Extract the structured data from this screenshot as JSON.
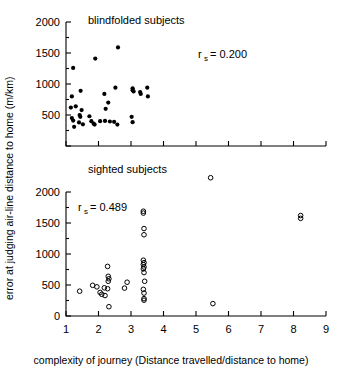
{
  "figure": {
    "xlabel": "complexity of journey (Distance travelled/distance to home)",
    "ylabel": "error at judging air-line distance to home (m/km)"
  },
  "chart_data": [
    {
      "type": "scatter",
      "title": "blindfolded subjects",
      "panel": "top",
      "marker": "filled-circle",
      "annotation": "r_s = 0.200",
      "annotation_symbol": "r",
      "annotation_subscript": "s",
      "annotation_value": "= 0.200",
      "xlabel": "complexity of journey (Distance travelled/distance to home)",
      "ylabel": "error at judging air-line distance to home (m/km)",
      "xlim": [
        1,
        9
      ],
      "ylim": [
        0,
        2000
      ],
      "xticks": [
        1,
        2,
        3,
        4,
        5,
        6,
        7,
        8,
        9
      ],
      "xticklabels": [
        "",
        "",
        "",
        "",
        "",
        "",
        "",
        "",
        ""
      ],
      "yticks": [
        0,
        500,
        1000,
        1500,
        2000
      ],
      "yticklabels": [
        "",
        "500",
        "1000",
        "1500",
        "2000"
      ],
      "grid": false,
      "legend": "none",
      "points": [
        [
          1.22,
          1260
        ],
        [
          1.18,
          800
        ],
        [
          1.15,
          620
        ],
        [
          1.3,
          640
        ],
        [
          1.18,
          450
        ],
        [
          1.22,
          410
        ],
        [
          1.25,
          310
        ],
        [
          1.45,
          890
        ],
        [
          1.48,
          580
        ],
        [
          1.42,
          500
        ],
        [
          1.44,
          470
        ],
        [
          1.4,
          380
        ],
        [
          1.52,
          350
        ],
        [
          1.9,
          1410
        ],
        [
          1.72,
          480
        ],
        [
          1.78,
          400
        ],
        [
          1.85,
          360
        ],
        [
          1.88,
          345
        ],
        [
          2.05,
          400
        ],
        [
          2.18,
          840
        ],
        [
          2.3,
          700
        ],
        [
          2.22,
          600
        ],
        [
          2.2,
          405
        ],
        [
          2.35,
          395
        ],
        [
          2.6,
          1590
        ],
        [
          2.52,
          940
        ],
        [
          2.48,
          390
        ],
        [
          2.58,
          345
        ],
        [
          3.05,
          930
        ],
        [
          3.05,
          900
        ],
        [
          3.08,
          880
        ],
        [
          3.02,
          470
        ],
        [
          3.05,
          385
        ],
        [
          3.28,
          870
        ],
        [
          3.3,
          840
        ],
        [
          3.5,
          940
        ],
        [
          3.52,
          800
        ]
      ]
    },
    {
      "type": "scatter",
      "title": "sighted subjects",
      "panel": "bottom",
      "marker": "open-circle",
      "annotation": "r_s = 0.489",
      "annotation_symbol": "r",
      "annotation_subscript": "s",
      "annotation_value": "= 0.489",
      "xlabel": "complexity of journey (Distance travelled/distance to home)",
      "ylabel": "error at judging air-line distance to home (m/km)",
      "xlim": [
        1,
        9
      ],
      "ylim": [
        0,
        2000
      ],
      "xticks": [
        1,
        2,
        3,
        4,
        5,
        6,
        7,
        8,
        9
      ],
      "xticklabels": [
        "1",
        "2",
        "3",
        "4",
        "5",
        "6",
        "7",
        "8",
        "9"
      ],
      "yticks": [
        0,
        500,
        1000,
        1500,
        2000
      ],
      "yticklabels": [
        "0",
        "500",
        "1000",
        "1500",
        "2000"
      ],
      "grid": false,
      "legend": "none",
      "outside_points": [
        [
          5.45,
          2230
        ]
      ],
      "points": [
        [
          1.42,
          400
        ],
        [
          1.82,
          495
        ],
        [
          1.95,
          470
        ],
        [
          2.05,
          380
        ],
        [
          2.1,
          350
        ],
        [
          2.18,
          455
        ],
        [
          2.2,
          330
        ],
        [
          2.28,
          800
        ],
        [
          2.3,
          640
        ],
        [
          2.32,
          600
        ],
        [
          2.3,
          560
        ],
        [
          2.28,
          440
        ],
        [
          2.32,
          150
        ],
        [
          2.8,
          450
        ],
        [
          2.88,
          545
        ],
        [
          3.38,
          1690
        ],
        [
          3.38,
          1660
        ],
        [
          3.4,
          1410
        ],
        [
          3.4,
          1310
        ],
        [
          3.38,
          900
        ],
        [
          3.4,
          860
        ],
        [
          3.38,
          830
        ],
        [
          3.4,
          790
        ],
        [
          3.38,
          760
        ],
        [
          3.4,
          700
        ],
        [
          3.42,
          560
        ],
        [
          3.38,
          430
        ],
        [
          3.4,
          370
        ],
        [
          3.4,
          280
        ],
        [
          3.4,
          255
        ],
        [
          5.52,
          200
        ],
        [
          8.22,
          1620
        ],
        [
          8.22,
          1575
        ]
      ]
    }
  ]
}
